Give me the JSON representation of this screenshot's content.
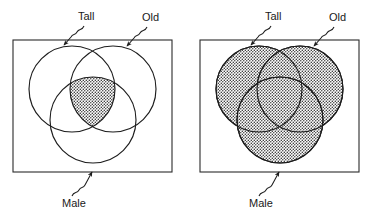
{
  "figure": {
    "panels": [
      {
        "id": "left",
        "name": "intersection-panel",
        "shading": "intersection-only",
        "shaded_region_label": "Tall AND Old AND Male",
        "frame": {
          "x": 13,
          "y": 40,
          "width": 159,
          "height": 132
        },
        "sets": [
          {
            "key": "tall",
            "label": "Tall",
            "cx": 72,
            "cy": 89,
            "r": 43
          },
          {
            "key": "old",
            "label": "Old",
            "cx": 113,
            "cy": 89,
            "r": 43
          },
          {
            "key": "male",
            "label": "Male",
            "cx": 93,
            "cy": 120,
            "r": 43
          }
        ],
        "labels": [
          {
            "key": "tall",
            "text": "Tall",
            "x": 78,
            "y": 20,
            "anchor": "start"
          },
          {
            "key": "old",
            "text": "Old",
            "x": 142,
            "y": 21,
            "anchor": "start"
          },
          {
            "key": "male",
            "text": "Male",
            "x": 62,
            "y": 207,
            "anchor": "start"
          }
        ]
      },
      {
        "id": "right",
        "name": "union-panel",
        "shading": "union-all",
        "shaded_region_label": "Tall OR Old OR Male",
        "frame": {
          "x": 200,
          "y": 40,
          "width": 159,
          "height": 132
        },
        "sets": [
          {
            "key": "tall",
            "label": "Tall",
            "cx": 259,
            "cy": 89,
            "r": 43
          },
          {
            "key": "old",
            "label": "Old",
            "cx": 300,
            "cy": 89,
            "r": 43
          },
          {
            "key": "male",
            "label": "Male",
            "cx": 280,
            "cy": 120,
            "r": 43
          }
        ],
        "labels": [
          {
            "key": "tall",
            "text": "Tall",
            "x": 265,
            "y": 20,
            "anchor": "start"
          },
          {
            "key": "old",
            "text": "Old",
            "x": 329,
            "y": 21,
            "anchor": "start"
          },
          {
            "key": "male",
            "text": "Male",
            "x": 249,
            "y": 207,
            "anchor": "start"
          }
        ]
      }
    ],
    "colors": {
      "background": "#ffffff",
      "stroke": "#1d1d1d",
      "frame_stroke": "#2b2b2b",
      "text": "#1a1a1a",
      "fill_pattern": "dotted-stipple"
    },
    "set_names": [
      "Tall",
      "Old",
      "Male"
    ]
  }
}
